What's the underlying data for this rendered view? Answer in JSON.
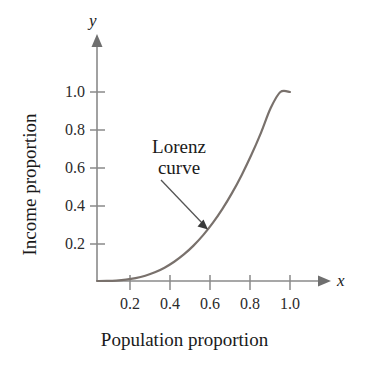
{
  "figure": {
    "width": 369,
    "height": 369,
    "background": "#ffffff"
  },
  "axes": {
    "x_axis_symbol": "x",
    "y_axis_symbol": "y",
    "x_axis_title": "Population proportion",
    "y_axis_title": "Income proportion",
    "axis_color": "#8a8a8a",
    "text_color": "#1a1a1a"
  },
  "annotation": {
    "line1": "Lorenz",
    "line2": "curve"
  },
  "chart_data": {
    "type": "line",
    "title": "",
    "subtitle": "",
    "xlabel": "Population proportion",
    "ylabel": "Income proportion",
    "xlim": [
      0,
      1.12
    ],
    "ylim": [
      0,
      1.12
    ],
    "xticks": [
      0.2,
      0.4,
      0.6,
      0.8,
      1.0
    ],
    "yticks": [
      0.2,
      0.4,
      0.6,
      0.8,
      1.0
    ],
    "xtick_labels": [
      "0.2",
      "0.4",
      "0.6",
      "0.8",
      "1.0"
    ],
    "ytick_labels": [
      "0.2",
      "0.4",
      "0.6",
      "0.8",
      "1.0"
    ],
    "grid": false,
    "legend": false,
    "legend_position": "none",
    "annotations": [
      {
        "text": "Lorenz curve",
        "points_to_x": 0.58,
        "points_to_y": 0.25,
        "text_x": 0.33,
        "text_y": 0.63
      }
    ],
    "series": [
      {
        "name": "Lorenz curve",
        "color": "#79716c",
        "linewidth": 2.2,
        "x": [
          0.0,
          0.05,
          0.1,
          0.15,
          0.2,
          0.25,
          0.3,
          0.35,
          0.4,
          0.45,
          0.5,
          0.55,
          0.6,
          0.65,
          0.7,
          0.75,
          0.8,
          0.85,
          0.9,
          0.95,
          1.0
        ],
        "y": [
          0.0,
          0.0003,
          0.0022,
          0.0068,
          0.0151,
          0.0279,
          0.0461,
          0.0705,
          0.1017,
          0.1404,
          0.1872,
          0.2427,
          0.3073,
          0.3817,
          0.4662,
          0.5614,
          0.6676,
          0.7853,
          0.9149,
          1.0,
          1.0
        ],
        "formula_note": "y = x^2.8"
      }
    ]
  }
}
